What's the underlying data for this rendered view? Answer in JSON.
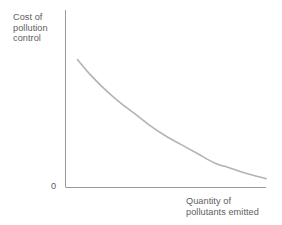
{
  "figure": {
    "background_color": "#ffffff",
    "axis_color": "#999999",
    "text_color": "#5e5e5e",
    "curve_color": "#b3b3b3"
  },
  "axes": {
    "y_axis_label": "Cost of\npollution\ncontrol",
    "x_axis_label": "Quantity of\npollutants emitted",
    "origin_label": "0"
  },
  "chart_data": {
    "type": "line",
    "title": "",
    "subtitle": "",
    "xlabel": "Quantity of pollutants emitted",
    "ylabel": "Cost of pollution control",
    "grid": false,
    "legend": null,
    "axis_tick_labels": {
      "x": [],
      "y": [
        "0"
      ]
    },
    "xlim": [
      0,
      100
    ],
    "ylim": [
      0,
      100
    ],
    "annotations": [],
    "series": [
      {
        "name": "Cost of pollution control",
        "color": "#b3b3b3",
        "line_width": 1.6,
        "x": [
          6,
          12,
          19,
          26,
          34,
          42,
          50,
          58,
          66,
          74,
          82,
          90,
          100
        ],
        "y": [
          72,
          64,
          56,
          49,
          42,
          35,
          29,
          24,
          19,
          14,
          11,
          8,
          5
        ],
        "shape": "convex decreasing, asymptotic to x-axis"
      }
    ]
  }
}
